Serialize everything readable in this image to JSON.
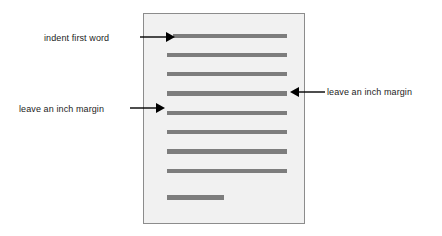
{
  "diagram": {
    "name": "manuscript-page-formatting-diagram",
    "page_sheet": {
      "label": "page-sheet",
      "background_color": "#f1f1f1",
      "border_color": "#8c8c8c"
    },
    "text_lines": {
      "color": "#7d7d7d",
      "count": 9,
      "lines": [
        {
          "id": "line-1",
          "indented": true,
          "left": 29,
          "top": 20,
          "width": 114,
          "height": 4
        },
        {
          "id": "line-2",
          "indented": false,
          "left": 23,
          "top": 39,
          "width": 120,
          "height": 4
        },
        {
          "id": "line-3",
          "indented": false,
          "left": 23,
          "top": 58,
          "width": 120,
          "height": 4
        },
        {
          "id": "line-4",
          "indented": false,
          "left": 23,
          "top": 77,
          "width": 120,
          "height": 5
        },
        {
          "id": "line-5",
          "indented": false,
          "left": 23,
          "top": 97,
          "width": 120,
          "height": 4
        },
        {
          "id": "line-6",
          "indented": false,
          "left": 23,
          "top": 116,
          "width": 120,
          "height": 4
        },
        {
          "id": "line-7",
          "indented": false,
          "left": 23,
          "top": 135,
          "width": 120,
          "height": 5
        },
        {
          "id": "line-8",
          "indented": false,
          "left": 23,
          "top": 155,
          "width": 120,
          "height": 4
        },
        {
          "id": "line-9",
          "indented": false,
          "left": 23,
          "top": 181,
          "width": 57,
          "height": 5
        }
      ]
    },
    "annotations": [
      {
        "id": "indent-first-word",
        "text": "indent first word",
        "arrow_direction": "right",
        "points_to": "first-text-line"
      },
      {
        "id": "left-margin",
        "text": "leave an inch margin",
        "arrow_direction": "right",
        "points_to": "page-left-edge"
      },
      {
        "id": "right-margin",
        "text": "leave an inch margin",
        "arrow_direction": "left",
        "points_to": "page-right-edge"
      }
    ],
    "colors": {
      "arrow": "#000000",
      "text": "#1c1c1c",
      "line": "#7d7d7d",
      "sheet_bg": "#f1f1f1",
      "sheet_border": "#8c8c8c",
      "canvas_bg": "#ffffff"
    }
  }
}
